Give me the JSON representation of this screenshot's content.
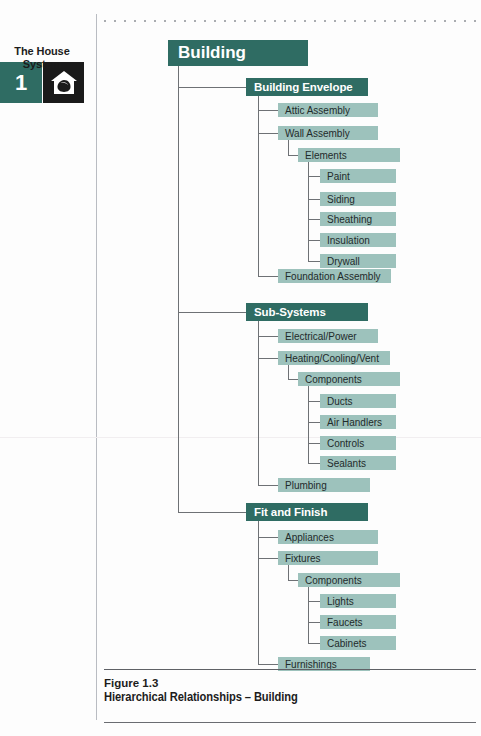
{
  "chapter": {
    "number": "1",
    "label": "The House\nSystem",
    "icon": "house-icon",
    "number_bg": "#2f6c63",
    "icon_bg": "#1a1a1a"
  },
  "caption": {
    "figure_number": "Figure 1.3",
    "title": "Hierarchical Relationships – Building"
  },
  "colors": {
    "dark_teal": "#2f6c63",
    "light_teal": "#9dc2bc",
    "connector": "#6e7175",
    "text_dark": "#1f2b2b",
    "text_light": "#ffffff"
  },
  "chart_data": {
    "type": "diagram",
    "diagram_type": "hierarchy-tree",
    "title": "Hierarchical Relationships – Building",
    "root": "Building",
    "levels": 5,
    "nodes": [
      {
        "id": "building",
        "label": "Building",
        "level": 1,
        "parent": null
      },
      {
        "id": "envelope",
        "label": "Building Envelope",
        "level": 2,
        "parent": "building"
      },
      {
        "id": "attic",
        "label": "Attic Assembly",
        "level": 3,
        "parent": "envelope"
      },
      {
        "id": "wall",
        "label": "Wall Assembly",
        "level": 3,
        "parent": "envelope"
      },
      {
        "id": "elements",
        "label": "Elements",
        "level": 4,
        "parent": "wall"
      },
      {
        "id": "paint",
        "label": "Paint",
        "level": 5,
        "parent": "elements"
      },
      {
        "id": "siding",
        "label": "Siding",
        "level": 5,
        "parent": "elements"
      },
      {
        "id": "sheathing",
        "label": "Sheathing",
        "level": 5,
        "parent": "elements"
      },
      {
        "id": "insulation",
        "label": "Insulation",
        "level": 5,
        "parent": "elements"
      },
      {
        "id": "drywall",
        "label": "Drywall",
        "level": 5,
        "parent": "elements"
      },
      {
        "id": "foundation",
        "label": "Foundation Assembly",
        "level": 3,
        "parent": "envelope"
      },
      {
        "id": "subsystems",
        "label": "Sub-Systems",
        "level": 2,
        "parent": "building"
      },
      {
        "id": "electrical",
        "label": "Electrical/Power",
        "level": 3,
        "parent": "subsystems"
      },
      {
        "id": "hvac",
        "label": "Heating/Cooling/Vent",
        "level": 3,
        "parent": "subsystems"
      },
      {
        "id": "components1",
        "label": "Components",
        "level": 4,
        "parent": "hvac"
      },
      {
        "id": "ducts",
        "label": "Ducts",
        "level": 5,
        "parent": "components1"
      },
      {
        "id": "airhandlers",
        "label": "Air Handlers",
        "level": 5,
        "parent": "components1"
      },
      {
        "id": "controls",
        "label": "Controls",
        "level": 5,
        "parent": "components1"
      },
      {
        "id": "sealants",
        "label": "Sealants",
        "level": 5,
        "parent": "components1"
      },
      {
        "id": "plumbing",
        "label": "Plumbing",
        "level": 3,
        "parent": "subsystems"
      },
      {
        "id": "fitfinish",
        "label": "Fit and Finish",
        "level": 2,
        "parent": "building"
      },
      {
        "id": "appliances",
        "label": "Appliances",
        "level": 3,
        "parent": "fitfinish"
      },
      {
        "id": "fixtures",
        "label": "Fixtures",
        "level": 3,
        "parent": "fitfinish"
      },
      {
        "id": "components2",
        "label": "Components",
        "level": 4,
        "parent": "fixtures"
      },
      {
        "id": "lights",
        "label": "Lights",
        "level": 5,
        "parent": "components2"
      },
      {
        "id": "faucets",
        "label": "Faucets",
        "level": 5,
        "parent": "components2"
      },
      {
        "id": "cabinets",
        "label": "Cabinets",
        "level": 5,
        "parent": "components2"
      },
      {
        "id": "furnishings",
        "label": "Furnishings",
        "level": 3,
        "parent": "fitfinish"
      }
    ]
  }
}
